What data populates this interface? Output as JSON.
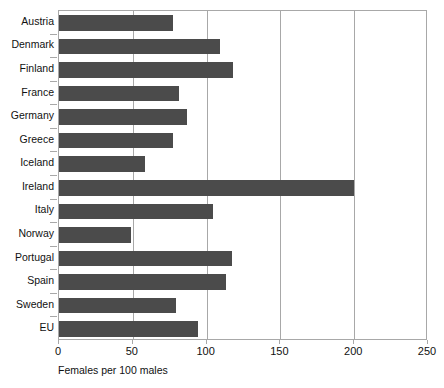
{
  "chart_data": {
    "type": "bar",
    "orientation": "horizontal",
    "title": "",
    "xlabel": "Females per 100 males",
    "ylabel": "",
    "categories": [
      "Austria",
      "Denmark",
      "Finland",
      "France",
      "Germany",
      "Greece",
      "Iceland",
      "Ireland",
      "Italy",
      "Norway",
      "Portugal",
      "Spain",
      "Sweden",
      "EU"
    ],
    "values": [
      77,
      109,
      118,
      81,
      87,
      77,
      58,
      200,
      104,
      49,
      117,
      113,
      79,
      94
    ],
    "xlim": [
      0,
      250
    ],
    "xticks": [
      0,
      50,
      100,
      150,
      200,
      250
    ],
    "xtick_labels": [
      "0",
      "50",
      "100",
      "150",
      "200",
      "250"
    ],
    "grid": "vertical",
    "legend": "none",
    "bar_color": "#4b4b4b",
    "axis_color": "#a8a8a8",
    "background_color": "#ffffff"
  }
}
